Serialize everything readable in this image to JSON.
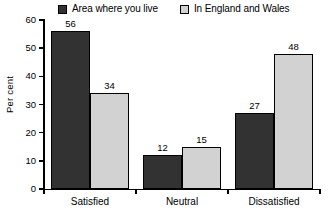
{
  "chart_data": {
    "type": "bar",
    "title": "",
    "xlabel": "",
    "ylabel": "Per cent",
    "categories": [
      "Satisfied",
      "Neutral",
      "Dissatisfied"
    ],
    "series": [
      {
        "name": "Area where you live",
        "values": [
          56,
          12,
          27
        ],
        "color": "#323232"
      },
      {
        "name": "In England and Wales",
        "values": [
          34,
          15,
          48
        ],
        "color": "#d2d2d2"
      }
    ],
    "ylim": [
      0,
      60
    ],
    "yticks": [
      0,
      10,
      20,
      30,
      40,
      50,
      60
    ],
    "ytick_labels": [
      "0",
      "10",
      "20",
      "30",
      "40",
      "50",
      "60"
    ],
    "grid": false,
    "legend_position": "top",
    "data_labels": true,
    "bar_border_color": "#000000",
    "axis_color": "#000000",
    "background": "#ffffff"
  },
  "legend": {
    "items": [
      {
        "label": "Area where you live",
        "swatch": "series-dark"
      },
      {
        "label": "In England and Wales",
        "swatch": "series-light"
      }
    ]
  }
}
